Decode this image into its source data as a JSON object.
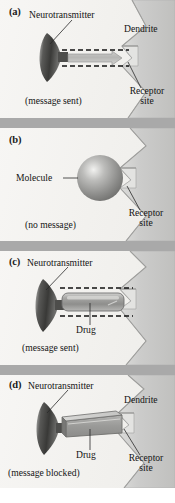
{
  "figure": {
    "width": 175,
    "height": 503,
    "background_color": "#ffffff",
    "panel_background_color": "#f3f2ef",
    "separator_color": "#a9a9a9",
    "structure_fill": "#c9c9c7",
    "neurotransmitter_color": "#4a4a4a",
    "drug_color": "#9c9c9a",
    "molecule_color": "#8f8f8f",
    "arrow_color": "#b4b4b2",
    "label_color": "#141414"
  },
  "panels": [
    {
      "id": "a",
      "letter": "(a)",
      "labels": {
        "neurotransmitter": "Neurotransmitter",
        "dendrite": "Dendrite",
        "receptor_site_line1": "Receptor",
        "receptor_site_line2": "site",
        "status": "(message sent)"
      },
      "elements": [
        "neurotransmitter-cone",
        "signal-arrow",
        "dashed-pathway",
        "dendrite-shape",
        "receptor-notch"
      ]
    },
    {
      "id": "b",
      "letter": "(b)",
      "labels": {
        "molecule": "Molecule",
        "receptor_site_line1": "Receptor",
        "receptor_site_line2": "site",
        "status": "(no message)"
      },
      "elements": [
        "molecule-sphere",
        "dendrite-shape",
        "receptor-notch"
      ]
    },
    {
      "id": "c",
      "letter": "(c)",
      "labels": {
        "neurotransmitter": "Neurotransmitter",
        "drug": "Drug",
        "status": "(message sent)"
      },
      "elements": [
        "neurotransmitter-cone",
        "drug-capsule",
        "dashed-pathway",
        "dendrite-shape",
        "receptor-notch"
      ]
    },
    {
      "id": "d",
      "letter": "(d)",
      "labels": {
        "neurotransmitter": "Neurotransmitter",
        "dendrite": "Dendrite",
        "drug": "Drug",
        "receptor_site_line1": "Receptor",
        "receptor_site_line2": "site",
        "status": "(message blocked)"
      },
      "elements": [
        "neurotransmitter-cone",
        "drug-block",
        "dendrite-shape",
        "receptor-notch"
      ]
    }
  ]
}
